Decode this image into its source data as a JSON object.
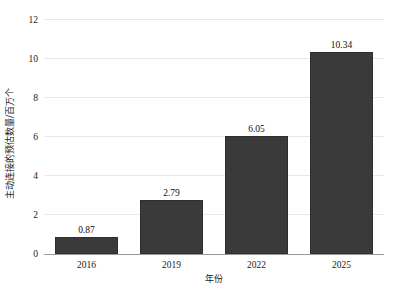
{
  "chart_data": {
    "type": "bar",
    "title": "",
    "xlabel": "年份",
    "ylabel": "主动连接的预估数量/百万个",
    "categories": [
      "2016",
      "2019",
      "2022",
      "2025"
    ],
    "values": [
      0.87,
      2.79,
      6.05,
      10.34
    ],
    "value_labels": [
      "0.87",
      "2.79",
      "6.05",
      "10.34"
    ],
    "ylim": [
      0,
      12
    ],
    "yticks": [
      0,
      2,
      4,
      6,
      8,
      10,
      12
    ],
    "ytick_labels": [
      "0",
      "2",
      "4",
      "6",
      "8",
      "10",
      "12"
    ],
    "grid": "horizontal",
    "legend": "none",
    "bar_color": "#3a3a3a",
    "grid_color": "#e8e8ec",
    "axis_color": "#9a9a9a",
    "background_color": "#ffffff"
  }
}
